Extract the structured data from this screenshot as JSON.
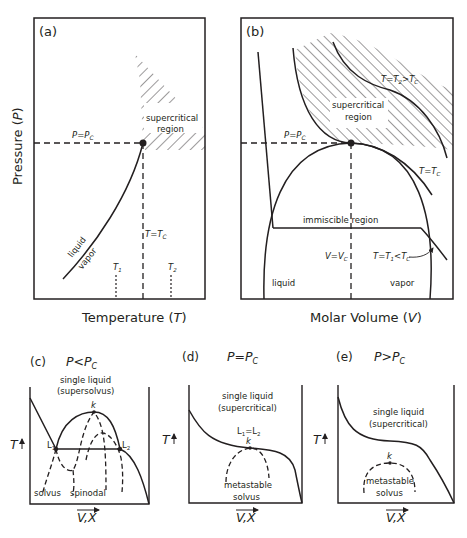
{
  "panel_a": {
    "label": "(a)",
    "ylabel": "Pressure (",
    "ylabel_var": "P",
    "ylabel_close": ")",
    "xlabel": "Temperature (",
    "xlabel_var": "T",
    "xlabel_close": ")",
    "p_eq_pc": "P=P",
    "p_sub": "C",
    "t_eq_tc": "T=T",
    "t_sub": "C",
    "region_line1": "supercritical",
    "region_line2": "region",
    "curve_label_top": "liquid",
    "curve_label_bottom": "vapor",
    "t1": "T",
    "t1_sub": "1",
    "t2": "T",
    "t2_sub": "2"
  },
  "panel_b": {
    "label": "(b)",
    "xlabel": "Molar Volume (",
    "xlabel_var": "V",
    "xlabel_close": ")",
    "p_eq_pc": "P=P",
    "p_sub": "C",
    "region_line1": "supercritical",
    "region_line2": "region",
    "t2_label": "T=T",
    "t2_sub": "2",
    "t2_rest": ">T",
    "t2_rest_sub": "C",
    "tc_label": "T=T",
    "tc_sub": "C",
    "immiscible": "immiscible region",
    "v_eq_vc": "V=V",
    "v_sub": "C",
    "t1_label": "T=T",
    "t1_sub": "1",
    "t1_rest": "<T",
    "t1_rest_sub": "C",
    "liquid": "liquid",
    "vapor": "vapor"
  },
  "panel_c": {
    "label": "(c)",
    "condition": "P<P",
    "condition_sub": "C",
    "region_line1": "single liquid",
    "region_line2": "(supersolvus)",
    "k": "k",
    "l1": "L",
    "l1_sub": "1",
    "l2": "L",
    "l2_sub": "2",
    "solvus": "solvus",
    "spinodal": "spinodal",
    "ylabel": "T",
    "xlabel": "V,X"
  },
  "panel_d": {
    "label": "(d)",
    "condition": "P=P",
    "condition_sub": "C",
    "region_line1": "single liquid",
    "region_line2": "(supercritical)",
    "l_eq": "L",
    "l_eq_sub1": "1",
    "l_eq_mid": "=L",
    "l_eq_sub2": "2",
    "k": "k",
    "metastable_line1": "metastable",
    "metastable_line2": "solvus",
    "ylabel": "T",
    "xlabel": "V,X"
  },
  "panel_e": {
    "label": "(e)",
    "condition": "P>P",
    "condition_sub": "C",
    "region_line1": "single liquid",
    "region_line2": "(supercritical)",
    "k": "k",
    "metastable_line1": "metastable",
    "metastable_line2": "solvus",
    "ylabel": "T",
    "xlabel": "V,X"
  },
  "colors": {
    "ink": "#231f20",
    "background": "#ffffff"
  }
}
